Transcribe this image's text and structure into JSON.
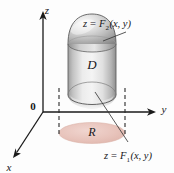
{
  "figure": {
    "background_color": "#fdfdfd",
    "axes": {
      "z_label": "z",
      "y_label": "y",
      "x_label": "x",
      "origin_label": "0",
      "axis_color": "#1a1a1a"
    },
    "solid": {
      "label": "D",
      "body_fill_light": "#f2f2f2",
      "body_fill_mid": "#d8d8d8",
      "body_fill_dark": "#a8a8a8",
      "outline_color": "#4a4a4a"
    },
    "region": {
      "label": "R",
      "fill_color": "#e8c4bc",
      "edge_color": "#d9b0a6"
    },
    "top_surface": {
      "equation_lhs": "z",
      "equation_eq": "=",
      "equation_fn": "F",
      "equation_sub": "2",
      "equation_args": "(x, y)"
    },
    "bottom_surface": {
      "equation_lhs": "z",
      "equation_eq": "=",
      "equation_fn": "F",
      "equation_sub": "1",
      "equation_args": "(x, y)"
    },
    "guides": {
      "dash_color": "#2b2b2b",
      "leader_color": "#3a3a3a"
    }
  }
}
